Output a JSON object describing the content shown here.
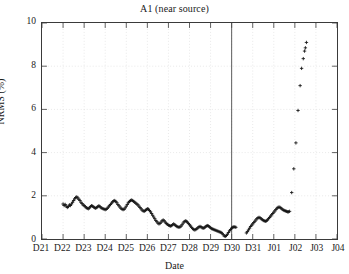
{
  "chart_data": {
    "type": "scatter",
    "title": "A1 (near source)",
    "xlabel": "Date",
    "ylabel": "NRMS (%)",
    "ylim": [
      0,
      10
    ],
    "ytick_values": [
      0,
      2,
      4,
      6,
      8,
      10
    ],
    "ytick_labels": [
      "0",
      "2",
      "4",
      "6",
      "8",
      "10"
    ],
    "xtick_labels": [
      "D21",
      "D22",
      "D23",
      "D24",
      "D25",
      "D26",
      "D27",
      "D28",
      "D29",
      "D30",
      "D31",
      "J01",
      "J02",
      "J03",
      "J04"
    ],
    "xlim_index": [
      0,
      14
    ],
    "grid": true,
    "grid_color": "#d8d8d8",
    "marker": "plus",
    "marker_color": "#111111",
    "legend": null,
    "annotations": [
      {
        "type": "vertical-line",
        "x_label": "D30",
        "x_index": 9,
        "color": "#4a4a4a"
      }
    ],
    "series": [
      {
        "name": "NRMS",
        "points": [
          [
            1.0,
            1.62
          ],
          [
            1.05,
            1.55
          ],
          [
            1.1,
            1.6
          ],
          [
            1.15,
            1.52
          ],
          [
            1.2,
            1.46
          ],
          [
            1.25,
            1.5
          ],
          [
            1.3,
            1.58
          ],
          [
            1.35,
            1.55
          ],
          [
            1.4,
            1.62
          ],
          [
            1.45,
            1.7
          ],
          [
            1.5,
            1.78
          ],
          [
            1.55,
            1.86
          ],
          [
            1.6,
            1.92
          ],
          [
            1.65,
            1.95
          ],
          [
            1.7,
            1.9
          ],
          [
            1.75,
            1.84
          ],
          [
            1.8,
            1.78
          ],
          [
            1.85,
            1.7
          ],
          [
            1.9,
            1.64
          ],
          [
            1.95,
            1.58
          ],
          [
            2.0,
            1.55
          ],
          [
            2.05,
            1.5
          ],
          [
            2.1,
            1.45
          ],
          [
            2.15,
            1.42
          ],
          [
            2.2,
            1.4
          ],
          [
            2.25,
            1.44
          ],
          [
            2.3,
            1.5
          ],
          [
            2.35,
            1.54
          ],
          [
            2.4,
            1.52
          ],
          [
            2.45,
            1.48
          ],
          [
            2.5,
            1.45
          ],
          [
            2.55,
            1.42
          ],
          [
            2.6,
            1.46
          ],
          [
            2.65,
            1.5
          ],
          [
            2.7,
            1.54
          ],
          [
            2.75,
            1.5
          ],
          [
            2.8,
            1.45
          ],
          [
            2.85,
            1.42
          ],
          [
            2.9,
            1.4
          ],
          [
            2.95,
            1.38
          ],
          [
            3.0,
            1.36
          ],
          [
            3.05,
            1.38
          ],
          [
            3.1,
            1.42
          ],
          [
            3.15,
            1.48
          ],
          [
            3.2,
            1.54
          ],
          [
            3.25,
            1.6
          ],
          [
            3.3,
            1.66
          ],
          [
            3.35,
            1.72
          ],
          [
            3.4,
            1.76
          ],
          [
            3.45,
            1.78
          ],
          [
            3.5,
            1.74
          ],
          [
            3.55,
            1.68
          ],
          [
            3.6,
            1.6
          ],
          [
            3.65,
            1.54
          ],
          [
            3.7,
            1.48
          ],
          [
            3.75,
            1.42
          ],
          [
            3.8,
            1.38
          ],
          [
            3.85,
            1.36
          ],
          [
            3.9,
            1.38
          ],
          [
            3.95,
            1.44
          ],
          [
            4.0,
            1.52
          ],
          [
            4.05,
            1.6
          ],
          [
            4.1,
            1.68
          ],
          [
            4.15,
            1.74
          ],
          [
            4.2,
            1.78
          ],
          [
            4.25,
            1.8
          ],
          [
            4.3,
            1.78
          ],
          [
            4.35,
            1.74
          ],
          [
            4.4,
            1.7
          ],
          [
            4.45,
            1.66
          ],
          [
            4.5,
            1.62
          ],
          [
            4.55,
            1.58
          ],
          [
            4.6,
            1.52
          ],
          [
            4.65,
            1.46
          ],
          [
            4.7,
            1.4
          ],
          [
            4.75,
            1.34
          ],
          [
            4.8,
            1.3
          ],
          [
            4.85,
            1.28
          ],
          [
            4.9,
            1.32
          ],
          [
            4.95,
            1.36
          ],
          [
            5.0,
            1.4
          ],
          [
            5.05,
            1.38
          ],
          [
            5.1,
            1.32
          ],
          [
            5.15,
            1.26
          ],
          [
            5.2,
            1.18
          ],
          [
            5.25,
            1.1
          ],
          [
            5.3,
            1.02
          ],
          [
            5.35,
            0.94
          ],
          [
            5.4,
            0.86
          ],
          [
            5.45,
            0.8
          ],
          [
            5.5,
            0.74
          ],
          [
            5.55,
            0.7
          ],
          [
            5.6,
            0.72
          ],
          [
            5.65,
            0.78
          ],
          [
            5.7,
            0.84
          ],
          [
            5.75,
            0.88
          ],
          [
            5.8,
            0.84
          ],
          [
            5.85,
            0.78
          ],
          [
            5.9,
            0.72
          ],
          [
            5.95,
            0.68
          ],
          [
            6.0,
            0.64
          ],
          [
            6.05,
            0.62
          ],
          [
            6.1,
            0.6
          ],
          [
            6.15,
            0.62
          ],
          [
            6.2,
            0.66
          ],
          [
            6.25,
            0.7
          ],
          [
            6.3,
            0.66
          ],
          [
            6.35,
            0.62
          ],
          [
            6.4,
            0.58
          ],
          [
            6.45,
            0.56
          ],
          [
            6.5,
            0.54
          ],
          [
            6.55,
            0.56
          ],
          [
            6.6,
            0.6
          ],
          [
            6.65,
            0.66
          ],
          [
            6.7,
            0.74
          ],
          [
            6.75,
            0.8
          ],
          [
            6.8,
            0.84
          ],
          [
            6.85,
            0.82
          ],
          [
            6.9,
            0.78
          ],
          [
            6.95,
            0.72
          ],
          [
            7.0,
            0.66
          ],
          [
            7.05,
            0.6
          ],
          [
            7.1,
            0.54
          ],
          [
            7.15,
            0.48
          ],
          [
            7.2,
            0.44
          ],
          [
            7.25,
            0.42
          ],
          [
            7.3,
            0.44
          ],
          [
            7.35,
            0.48
          ],
          [
            7.4,
            0.52
          ],
          [
            7.45,
            0.56
          ],
          [
            7.5,
            0.58
          ],
          [
            7.55,
            0.56
          ],
          [
            7.6,
            0.52
          ],
          [
            7.65,
            0.5
          ],
          [
            7.7,
            0.52
          ],
          [
            7.75,
            0.56
          ],
          [
            7.8,
            0.6
          ],
          [
            7.85,
            0.62
          ],
          [
            7.9,
            0.6
          ],
          [
            7.95,
            0.56
          ],
          [
            8.0,
            0.52
          ],
          [
            8.05,
            0.48
          ],
          [
            8.1,
            0.46
          ],
          [
            8.15,
            0.44
          ],
          [
            8.2,
            0.42
          ],
          [
            8.25,
            0.4
          ],
          [
            8.3,
            0.38
          ],
          [
            8.35,
            0.36
          ],
          [
            8.4,
            0.34
          ],
          [
            8.45,
            0.32
          ],
          [
            8.5,
            0.3
          ],
          [
            8.55,
            0.26
          ],
          [
            8.6,
            0.2
          ],
          [
            8.65,
            0.14
          ],
          [
            8.7,
            0.12
          ],
          [
            8.75,
            0.16
          ],
          [
            8.8,
            0.22
          ],
          [
            8.85,
            0.3
          ],
          [
            8.9,
            0.38
          ],
          [
            8.95,
            0.44
          ],
          [
            9.0,
            0.5
          ],
          [
            9.05,
            0.54
          ],
          [
            9.1,
            0.56
          ],
          [
            9.15,
            0.56
          ],
          [
            9.2,
            0.54
          ],
          [
            9.7,
            0.28
          ],
          [
            9.75,
            0.34
          ],
          [
            9.8,
            0.42
          ],
          [
            9.85,
            0.5
          ],
          [
            9.9,
            0.58
          ],
          [
            9.95,
            0.64
          ],
          [
            10.0,
            0.7
          ],
          [
            10.05,
            0.76
          ],
          [
            10.1,
            0.82
          ],
          [
            10.15,
            0.88
          ],
          [
            10.2,
            0.94
          ],
          [
            10.25,
            0.98
          ],
          [
            10.3,
            1.0
          ],
          [
            10.35,
            0.98
          ],
          [
            10.4,
            0.94
          ],
          [
            10.45,
            0.9
          ],
          [
            10.5,
            0.86
          ],
          [
            10.55,
            0.84
          ],
          [
            10.6,
            0.82
          ],
          [
            10.65,
            0.84
          ],
          [
            10.7,
            0.88
          ],
          [
            10.75,
            0.94
          ],
          [
            10.8,
            1.0
          ],
          [
            10.85,
            1.06
          ],
          [
            10.9,
            1.12
          ],
          [
            10.95,
            1.18
          ],
          [
            11.0,
            1.24
          ],
          [
            11.05,
            1.3
          ],
          [
            11.1,
            1.36
          ],
          [
            11.15,
            1.42
          ],
          [
            11.2,
            1.46
          ],
          [
            11.25,
            1.48
          ],
          [
            11.3,
            1.46
          ],
          [
            11.35,
            1.42
          ],
          [
            11.4,
            1.38
          ],
          [
            11.45,
            1.34
          ],
          [
            11.5,
            1.32
          ],
          [
            11.55,
            1.3
          ],
          [
            11.6,
            1.28
          ],
          [
            11.65,
            1.26
          ],
          [
            11.7,
            1.26
          ],
          [
            11.75,
            1.28
          ],
          [
            11.85,
            2.15
          ],
          [
            11.95,
            3.25
          ],
          [
            12.05,
            4.45
          ],
          [
            12.15,
            5.95
          ],
          [
            12.25,
            7.1
          ],
          [
            12.32,
            7.9
          ],
          [
            12.4,
            8.35
          ],
          [
            12.46,
            8.7
          ],
          [
            12.5,
            8.85
          ],
          [
            12.55,
            9.1
          ]
        ]
      }
    ]
  }
}
